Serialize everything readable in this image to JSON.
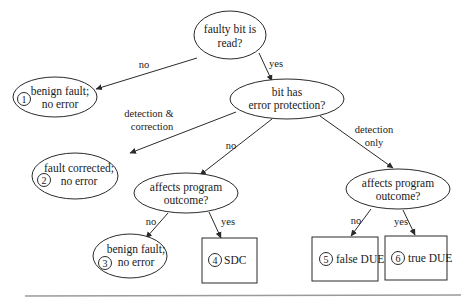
{
  "diagram": {
    "nodes": {
      "faulty_bit_read": {
        "line1": "faulty bit is",
        "line2": "read?"
      },
      "error_protection": {
        "line1": "bit has",
        "line2": "error protection?"
      },
      "benign_1": {
        "num": "1",
        "line1": "benign fault;",
        "line2": "no error"
      },
      "corrected_2": {
        "num": "2",
        "line1": "fault corrected;",
        "line2": "no error"
      },
      "affects_left": {
        "line1": "affects program",
        "line2": "outcome?"
      },
      "affects_right": {
        "line1": "affects program",
        "line2": "outcome?"
      },
      "benign_3": {
        "num": "3",
        "line1": "benign fault;",
        "line2": "no error"
      },
      "sdc_4": {
        "num": "4",
        "label": "SDC"
      },
      "false_due_5": {
        "num": "5",
        "label": "false DUE"
      },
      "true_due_6": {
        "num": "6",
        "label": "true DUE"
      }
    },
    "edges": {
      "read_no": "no",
      "read_yes": "yes",
      "prot_detcorr_1": "detection &",
      "prot_detcorr_2": "correction",
      "prot_no": "no",
      "prot_detonly_1": "detection",
      "prot_detonly_2": "only",
      "left_no": "no",
      "left_yes": "yes",
      "right_no": "no",
      "right_yes": "yes"
    }
  }
}
